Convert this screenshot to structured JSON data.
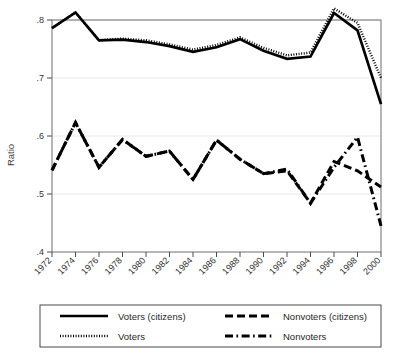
{
  "chart_data": {
    "type": "line",
    "title": "",
    "xlabel": "",
    "ylabel": "Ratio",
    "xlim": [
      1972,
      2000
    ],
    "ylim": [
      0.4,
      0.8
    ],
    "y_ticks": [
      ".4",
      ".5",
      ".6",
      ".7",
      ".8"
    ],
    "y_tick_values": [
      0.4,
      0.5,
      0.6,
      0.7,
      0.8
    ],
    "grid": "horizontal",
    "legend_position": "bottom",
    "categories": [
      1972,
      1974,
      1976,
      1978,
      1980,
      1982,
      1984,
      1986,
      1988,
      1990,
      1992,
      1994,
      1996,
      1998,
      2000
    ],
    "x_tick_labels": [
      "1972",
      "1974",
      "1976",
      "1978",
      "1980",
      "1982",
      "1984",
      "1986",
      "1988",
      "1990",
      "1992",
      "1994",
      "1996",
      "1998",
      "2000"
    ],
    "series": [
      {
        "name": "Voters (citizens)",
        "style": "solid",
        "color": "#000000",
        "values": [
          0.786,
          0.813,
          0.765,
          0.766,
          0.762,
          0.755,
          0.745,
          0.753,
          0.767,
          0.747,
          0.733,
          0.737,
          0.812,
          0.782,
          0.655
        ]
      },
      {
        "name": "Voters",
        "style": "dotted",
        "color": "#000000",
        "values": [
          0.786,
          0.813,
          0.765,
          0.768,
          0.765,
          0.758,
          0.749,
          0.757,
          0.77,
          0.752,
          0.739,
          0.744,
          0.82,
          0.795,
          0.7
        ]
      },
      {
        "name": "Nonvoters (citizens)",
        "style": "dashed",
        "color": "#000000",
        "values": [
          0.541,
          0.623,
          0.546,
          0.594,
          0.565,
          0.574,
          0.525,
          0.593,
          0.56,
          0.535,
          0.54,
          0.484,
          0.556,
          0.54,
          0.512
        ]
      },
      {
        "name": "Nonvoters",
        "style": "dash-dot",
        "color": "#000000",
        "values": [
          0.541,
          0.623,
          0.546,
          0.594,
          0.565,
          0.574,
          0.525,
          0.593,
          0.56,
          0.535,
          0.543,
          0.484,
          0.546,
          0.598,
          0.445
        ]
      }
    ]
  },
  "legend": {
    "entries": [
      {
        "label": "Voters (citizens)",
        "style": "solid"
      },
      {
        "label": "Nonvoters (citizens)",
        "style": "dashed"
      },
      {
        "label": "Voters",
        "style": "dotted"
      },
      {
        "label": "Nonvoters",
        "style": "dash-dot"
      }
    ]
  }
}
